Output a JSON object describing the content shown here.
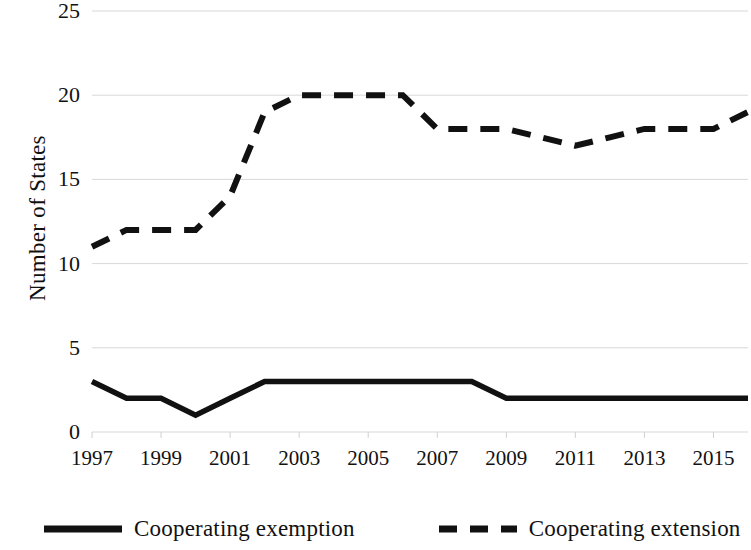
{
  "chart_data": {
    "type": "line",
    "title": "",
    "xlabel": "",
    "ylabel": "Number of States",
    "x": [
      1997,
      1998,
      1999,
      2000,
      2001,
      2002,
      2003,
      2004,
      2005,
      2006,
      2007,
      2008,
      2009,
      2010,
      2011,
      2012,
      2013,
      2014,
      2015,
      2016
    ],
    "xlim": [
      1997,
      2016
    ],
    "ylim": [
      0,
      25
    ],
    "ytick_values": [
      0,
      5,
      10,
      15,
      20,
      25
    ],
    "ytick_labels": [
      "0",
      "5",
      "10",
      "15",
      "20",
      "25"
    ],
    "xtick_values": [
      1997,
      1999,
      2001,
      2003,
      2005,
      2007,
      2009,
      2011,
      2013,
      2015
    ],
    "xtick_labels": [
      "1997",
      "1999",
      "2001",
      "2003",
      "2005",
      "2007",
      "2009",
      "2011",
      "2013",
      "2015"
    ],
    "grid": "horizontal",
    "legend_position": "bottom",
    "series": [
      {
        "name": "Cooperating exemption",
        "style": "solid",
        "color": "#111111",
        "values": [
          3,
          2,
          2,
          1,
          2,
          3,
          3,
          3,
          3,
          3,
          3,
          3,
          2,
          2,
          2,
          2,
          2,
          2,
          2,
          2
        ]
      },
      {
        "name": "Cooperating extension",
        "style": "dashed",
        "color": "#111111",
        "values": [
          11,
          12,
          12,
          12,
          14,
          19,
          20,
          20,
          20,
          20,
          18,
          18,
          18,
          17.5,
          17,
          17.5,
          18,
          18,
          18,
          19
        ]
      }
    ]
  },
  "axis": {
    "y_title": "Number of States"
  },
  "legend": {
    "items": [
      {
        "label": "Cooperating exemption",
        "style": "solid"
      },
      {
        "label": "Cooperating extension",
        "style": "dashed"
      }
    ]
  }
}
